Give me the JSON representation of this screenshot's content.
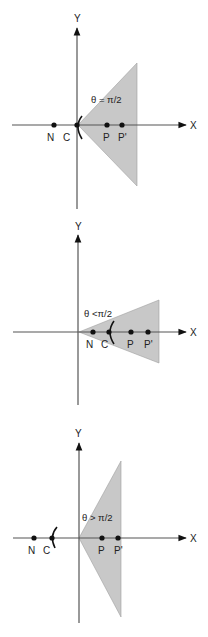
{
  "colors": {
    "axis": "#555555",
    "wedge_fill": "#c8c8c8",
    "point": "#111111",
    "background": "#ffffff"
  },
  "axes_labels": {
    "x": "X",
    "y": "Y"
  },
  "panels": [
    {
      "name": "panel-theta-equal",
      "angle_label": "θ = π/2",
      "points": [
        {
          "label": "N",
          "x": 54
        },
        {
          "label": "C",
          "x": 77
        },
        {
          "label": "P",
          "x": 107
        },
        {
          "label": "P'",
          "x": 122
        }
      ]
    },
    {
      "name": "panel-theta-less",
      "angle_label": "θ <π/2",
      "points": [
        {
          "label": "N",
          "x": 93
        },
        {
          "label": "C",
          "x": 109
        },
        {
          "label": "P",
          "x": 131
        },
        {
          "label": "P'",
          "x": 148
        }
      ]
    },
    {
      "name": "panel-theta-greater",
      "angle_label": "θ > π/2",
      "points": [
        {
          "label": "N",
          "x": 34
        },
        {
          "label": "C",
          "x": 52
        },
        {
          "label": "P",
          "x": 102
        },
        {
          "label": "P'",
          "x": 118
        }
      ]
    }
  ]
}
